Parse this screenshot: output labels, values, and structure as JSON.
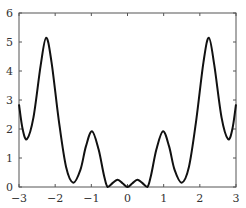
{
  "chart_data": {
    "type": "line",
    "title": "",
    "xlabel": "",
    "ylabel": "",
    "xlim": [
      -3,
      3
    ],
    "ylim": [
      0,
      6
    ],
    "grid": false,
    "legend": null,
    "x_ticks": [
      "−3",
      "−2",
      "−1",
      "0",
      "1",
      "2",
      "3"
    ],
    "y_ticks": [
      "0",
      "1",
      "2",
      "3",
      "4",
      "5",
      "6"
    ],
    "series": [
      {
        "name": "f(x)",
        "color": "#111111",
        "x": [
          -3.0,
          -2.9,
          -2.78,
          -2.6,
          -2.4,
          -2.25,
          -2.1,
          -1.9,
          -1.7,
          -1.5,
          -1.3,
          -1.15,
          -0.98,
          -0.8,
          -0.65,
          -0.55,
          -0.4,
          -0.27,
          -0.13,
          0.0,
          0.13,
          0.27,
          0.4,
          0.55,
          0.65,
          0.8,
          0.98,
          1.15,
          1.3,
          1.5,
          1.7,
          1.9,
          2.1,
          2.25,
          2.4,
          2.6,
          2.78,
          2.9,
          3.0
        ],
        "y": [
          2.85,
          2.0,
          1.65,
          2.4,
          4.2,
          5.15,
          4.3,
          2.3,
          0.7,
          0.15,
          0.6,
          1.4,
          1.92,
          1.3,
          0.4,
          0.0,
          0.15,
          0.25,
          0.12,
          0.0,
          0.12,
          0.25,
          0.15,
          0.0,
          0.4,
          1.3,
          1.92,
          1.4,
          0.6,
          0.15,
          0.7,
          2.3,
          4.3,
          5.15,
          4.2,
          2.4,
          1.65,
          2.0,
          2.85
        ]
      }
    ]
  }
}
